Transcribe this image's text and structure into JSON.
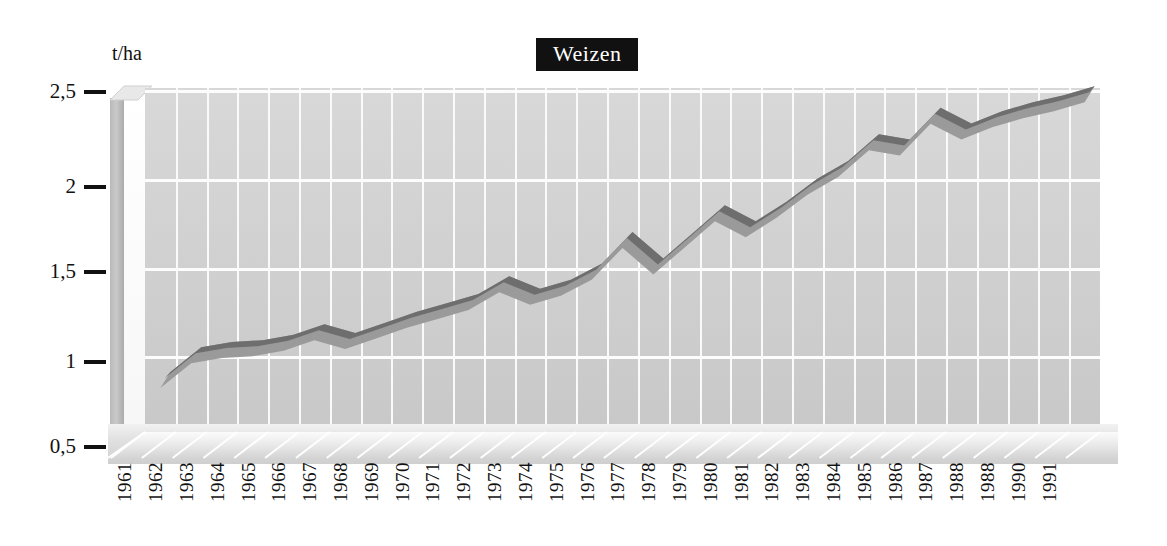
{
  "chart": {
    "title": "Weizen",
    "y_unit": "t/ha",
    "yticks": [
      "2,5",
      "2",
      "1,5",
      "1",
      "0,5"
    ],
    "xlabels": [
      "1961",
      "1962",
      "1963",
      "1964",
      "1965",
      "1966",
      "1967",
      "1968",
      "1969",
      "1970",
      "1971",
      "1972",
      "1973",
      "1974",
      "1975",
      "1976",
      "1977",
      "1978",
      "1979",
      "1980",
      "1981",
      "1982",
      "1983",
      "1984",
      "1985",
      "1986",
      "1987",
      "1988",
      "1988",
      "1990",
      "1991"
    ]
  },
  "chart_data": {
    "type": "line",
    "title": "Weizen",
    "xlabel": "",
    "ylabel": "t/ha",
    "ylim": [
      0.5,
      2.5
    ],
    "yticks": [
      0.5,
      1.0,
      1.5,
      2.0,
      2.5
    ],
    "ytick_labels": [
      "0,5",
      "1",
      "1,5",
      "2",
      "2,5"
    ],
    "grid": true,
    "legend": "none",
    "style": "3d-ribbon",
    "x": [
      "1961",
      "1962",
      "1963",
      "1964",
      "1965",
      "1966",
      "1967",
      "1968",
      "1969",
      "1970",
      "1971",
      "1972",
      "1973",
      "1974",
      "1975",
      "1976",
      "1977",
      "1978",
      "1979",
      "1980",
      "1981",
      "1982",
      "1983",
      "1984",
      "1985",
      "1986",
      "1987",
      "1988",
      "1988",
      "1990",
      "1991"
    ],
    "series": [
      {
        "name": "Weizen Ertrag",
        "unit": "t/ha",
        "values": [
          0.86,
          1.0,
          1.03,
          1.04,
          1.07,
          1.13,
          1.08,
          1.14,
          1.2,
          1.25,
          1.3,
          1.4,
          1.33,
          1.38,
          1.47,
          1.65,
          1.5,
          1.65,
          1.8,
          1.71,
          1.82,
          1.95,
          2.05,
          2.2,
          2.17,
          2.35,
          2.26,
          2.33,
          2.38,
          2.42,
          2.47
        ]
      }
    ],
    "colors": {
      "ribbon_top": "#6e6e6e",
      "ribbon_front": "#9a9a9a",
      "panel": "#d2d2d2",
      "gridline": "#fafafa",
      "title_bg": "#111111",
      "title_fg": "#ffffff",
      "text": "#111111"
    }
  }
}
